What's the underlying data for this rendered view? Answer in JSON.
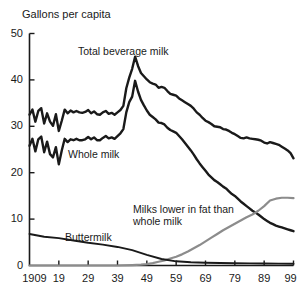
{
  "chart_data": {
    "type": "line",
    "title": "Gallons per capita",
    "xlabel": "",
    "ylabel": "Gallons per capita",
    "xlim": [
      1909,
      1999
    ],
    "ylim": [
      0,
      50
    ],
    "grid": false,
    "legend_position": "inline-annotations",
    "y_ticks": [
      "0",
      "10",
      "20",
      "30",
      "40",
      "50"
    ],
    "x_ticks": [
      "1909",
      "19",
      "29",
      "39",
      "49",
      "59",
      "69",
      "79",
      "89",
      "99"
    ],
    "x_tick_values": [
      1909,
      1919,
      1929,
      1939,
      1949,
      1959,
      1969,
      1979,
      1989,
      1999
    ],
    "series": [
      {
        "name": "Total beverage milk",
        "color": "#1a1a1a",
        "label_text": "Total beverage milk",
        "x": [
          1909,
          1910,
          1911,
          1912,
          1913,
          1914,
          1915,
          1916,
          1917,
          1918,
          1919,
          1920,
          1921,
          1922,
          1923,
          1924,
          1925,
          1926,
          1927,
          1928,
          1929,
          1930,
          1931,
          1932,
          1933,
          1934,
          1935,
          1936,
          1937,
          1938,
          1939,
          1940,
          1941,
          1942,
          1943,
          1944,
          1945,
          1946,
          1947,
          1948,
          1949,
          1950,
          1951,
          1952,
          1953,
          1954,
          1955,
          1956,
          1957,
          1958,
          1959,
          1960,
          1961,
          1962,
          1963,
          1964,
          1965,
          1966,
          1967,
          1968,
          1969,
          1970,
          1971,
          1972,
          1973,
          1974,
          1975,
          1976,
          1977,
          1978,
          1979,
          1980,
          1981,
          1982,
          1983,
          1984,
          1985,
          1986,
          1987,
          1988,
          1989,
          1990,
          1991,
          1992,
          1993,
          1994,
          1995,
          1996,
          1997,
          1998,
          1999
        ],
        "values": [
          32.5,
          33.6,
          31.0,
          33.3,
          33.9,
          30.6,
          32.8,
          31.0,
          30.1,
          32.6,
          29.0,
          31.2,
          33.6,
          32.8,
          33.4,
          33.0,
          33.3,
          33.0,
          32.9,
          33.1,
          33.5,
          32.8,
          33.2,
          32.6,
          32.5,
          33.0,
          33.3,
          32.7,
          32.9,
          32.5,
          33.0,
          33.5,
          34.4,
          38.2,
          40.5,
          42.4,
          45.0,
          43.0,
          41.5,
          40.8,
          40.1,
          39.5,
          39.2,
          39.0,
          38.3,
          38.5,
          38.3,
          37.6,
          37.0,
          36.8,
          36.6,
          36.0,
          35.6,
          35.2,
          34.8,
          34.4,
          33.8,
          33.0,
          32.5,
          31.8,
          31.2,
          30.9,
          30.5,
          30.0,
          29.9,
          29.8,
          29.4,
          29.3,
          29.0,
          28.6,
          28.3,
          27.9,
          27.5,
          27.4,
          27.6,
          27.4,
          27.3,
          27.2,
          27.1,
          26.9,
          26.5,
          26.3,
          26.6,
          26.4,
          26.2,
          26.0,
          25.6,
          25.2,
          24.8,
          24.2,
          23.1
        ]
      },
      {
        "name": "Whole milk",
        "color": "#1a1a1a",
        "label_text": "Whole milk",
        "x": [
          1909,
          1910,
          1911,
          1912,
          1913,
          1914,
          1915,
          1916,
          1917,
          1918,
          1919,
          1920,
          1921,
          1922,
          1923,
          1924,
          1925,
          1926,
          1927,
          1928,
          1929,
          1930,
          1931,
          1932,
          1933,
          1934,
          1935,
          1936,
          1937,
          1938,
          1939,
          1940,
          1941,
          1942,
          1943,
          1944,
          1945,
          1946,
          1947,
          1948,
          1949,
          1950,
          1951,
          1952,
          1953,
          1954,
          1955,
          1956,
          1957,
          1958,
          1959,
          1960,
          1961,
          1962,
          1963,
          1964,
          1965,
          1966,
          1967,
          1968,
          1969,
          1970,
          1971,
          1972,
          1973,
          1974,
          1975,
          1976,
          1977,
          1978,
          1979,
          1980,
          1981,
          1982,
          1983,
          1984,
          1985,
          1986,
          1987,
          1988,
          1989,
          1990,
          1991,
          1992,
          1993,
          1994,
          1995,
          1996,
          1997,
          1998,
          1999
        ],
        "values": [
          25.8,
          27.3,
          24.6,
          27.2,
          27.8,
          24.4,
          26.7,
          24.0,
          23.3,
          25.5,
          21.8,
          24.8,
          27.3,
          26.6,
          27.2,
          27.0,
          27.3,
          27.0,
          27.0,
          27.2,
          27.7,
          27.2,
          27.6,
          27.0,
          27.0,
          27.5,
          27.9,
          27.4,
          27.6,
          27.3,
          27.9,
          28.5,
          29.4,
          33.0,
          35.2,
          36.4,
          39.8,
          37.5,
          35.7,
          34.5,
          33.4,
          32.5,
          32.0,
          31.5,
          30.8,
          30.7,
          30.4,
          29.7,
          29.2,
          28.9,
          28.6,
          27.9,
          27.2,
          26.4,
          25.6,
          24.8,
          23.9,
          22.9,
          22.0,
          21.2,
          20.4,
          19.6,
          19.0,
          18.4,
          18.0,
          17.5,
          17.0,
          16.6,
          16.0,
          15.4,
          15.0,
          14.4,
          13.8,
          13.3,
          12.8,
          12.3,
          11.8,
          11.4,
          11.0,
          10.5,
          10.0,
          9.6,
          9.2,
          8.9,
          8.6,
          8.4,
          8.2,
          8.0,
          7.8,
          7.6,
          7.4
        ]
      },
      {
        "name": "Milks lower in fat than whole milk",
        "color": "#8c8c8c",
        "label_text": "Milks lower in fat than whole milk",
        "x": [
          1909,
          1919,
          1929,
          1939,
          1944,
          1947,
          1949,
          1951,
          1953,
          1955,
          1957,
          1959,
          1961,
          1963,
          1965,
          1967,
          1969,
          1971,
          1973,
          1975,
          1977,
          1979,
          1981,
          1983,
          1985,
          1987,
          1989,
          1991,
          1993,
          1995,
          1997,
          1999
        ],
        "values": [
          0.0,
          0.0,
          0.0,
          0.0,
          0.1,
          0.2,
          0.3,
          0.5,
          0.8,
          1.1,
          1.5,
          1.9,
          2.4,
          3.0,
          3.7,
          4.4,
          5.2,
          6.0,
          6.8,
          7.6,
          8.3,
          9.0,
          9.7,
          10.4,
          11.0,
          11.8,
          12.8,
          14.0,
          14.4,
          14.6,
          14.6,
          14.5
        ]
      },
      {
        "name": "Buttermilk",
        "color": "#1a1a1a",
        "label_text": "Buttermilk",
        "x": [
          1909,
          1914,
          1919,
          1924,
          1929,
          1934,
          1939,
          1944,
          1949,
          1954,
          1959,
          1964,
          1969,
          1974,
          1979,
          1984,
          1989,
          1994,
          1999
        ],
        "values": [
          6.8,
          6.2,
          5.9,
          5.4,
          4.9,
          4.5,
          4.0,
          3.3,
          2.3,
          1.4,
          0.9,
          0.7,
          0.6,
          0.55,
          0.5,
          0.45,
          0.42,
          0.4,
          0.38
        ]
      }
    ],
    "annotations": [
      {
        "name": "total-beverage-milk-label",
        "text": "Total beverage milk",
        "x_px": 78,
        "y_px": 45
      },
      {
        "name": "whole-milk-label",
        "text": "Whole milk",
        "x_px": 68,
        "y_px": 148
      },
      {
        "name": "milks-lower-in-fat-label",
        "text": "Milks lower in fat than whole milk",
        "x_px": 133,
        "y_px": 203
      },
      {
        "name": "buttermilk-label",
        "text": "Buttermilk",
        "x_px": 65,
        "y_px": 231
      }
    ]
  },
  "axes": {
    "title": "Gallons per capita",
    "y_ticks": [
      {
        "label": "50",
        "value": 50
      },
      {
        "label": "40",
        "value": 40
      },
      {
        "label": "30",
        "value": 30
      },
      {
        "label": "20",
        "value": 20
      },
      {
        "label": "10",
        "value": 10
      },
      {
        "label": "0",
        "value": 0
      }
    ],
    "x_ticks": [
      {
        "label": "1909",
        "value": 1909
      },
      {
        "label": "19",
        "value": 1919
      },
      {
        "label": "29",
        "value": 1929
      },
      {
        "label": "39",
        "value": 1939
      },
      {
        "label": "49",
        "value": 1949
      },
      {
        "label": "59",
        "value": 1959
      },
      {
        "label": "69",
        "value": 1969
      },
      {
        "label": "79",
        "value": 1979
      },
      {
        "label": "89",
        "value": 1989
      },
      {
        "label": "99",
        "value": 1999
      }
    ]
  },
  "colors": {
    "axis": "#1a1a1a",
    "dark_series": "#1a1a1a",
    "grey_series": "#8c8c8c",
    "background": "#ffffff"
  }
}
